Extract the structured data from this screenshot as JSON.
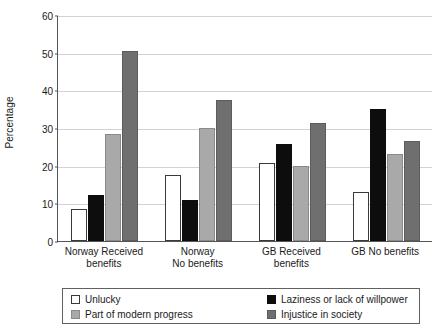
{
  "chart_data": {
    "type": "bar",
    "title": "",
    "xlabel": "",
    "ylabel": "Percentage",
    "ylim": [
      0,
      60
    ],
    "yticks": [
      0,
      10,
      20,
      30,
      40,
      50,
      60
    ],
    "grid": true,
    "legend_position": "bottom",
    "categories": [
      "Norway Received benefits",
      "Norway No benefits",
      "GB Received benefits",
      "GB No benefits"
    ],
    "category_lines": [
      [
        "Norway  Received",
        "benefits"
      ],
      [
        "Norway",
        "No benefits"
      ],
      [
        "GB  Received",
        "benefits"
      ],
      [
        "GB No benefits",
        ""
      ]
    ],
    "series": [
      {
        "name": "Unlucky",
        "color": "#ffffff",
        "values": [
          8.5,
          17.5,
          20.7,
          13.0
        ]
      },
      {
        "name": "Laziness or lack of willpower",
        "color": "#0d0d0d",
        "values": [
          12.3,
          11.0,
          25.7,
          35.0
        ]
      },
      {
        "name": "Part of modern progress",
        "color": "#a9a9a9",
        "values": [
          28.5,
          30.0,
          20.0,
          23.0
        ]
      },
      {
        "name": "Injustice in society",
        "color": "#6f6f6f",
        "values": [
          50.5,
          37.5,
          31.3,
          26.5
        ]
      }
    ]
  }
}
